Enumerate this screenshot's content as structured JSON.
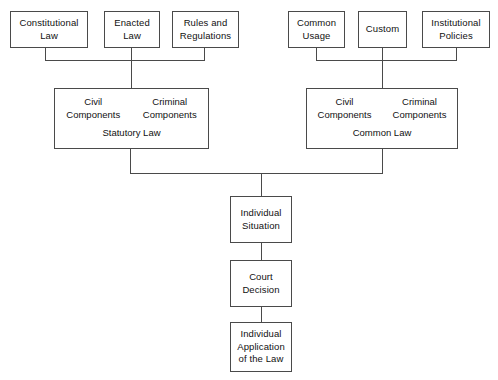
{
  "diagram": {
    "background_color": "#ffffff",
    "line_color": "#4a4a4a",
    "text_color": "#111111",
    "branches": {
      "left": {
        "name": "Statutory Law branch",
        "sources": [
          {
            "id": "constitutional-law",
            "line1": "Constitutional",
            "line2": "Law"
          },
          {
            "id": "enacted-law",
            "line1": "Enacted",
            "line2": "Law"
          },
          {
            "id": "rules-and-regulations",
            "line1": "Rules and",
            "line2": "Regulations"
          }
        ],
        "result": {
          "id": "statutory-law",
          "title": "Statutory Law",
          "columns": [
            {
              "id": "civil-components",
              "line1": "Civil",
              "line2": "Components"
            },
            {
              "id": "criminal-components",
              "line1": "Criminal",
              "line2": "Components"
            }
          ]
        }
      },
      "right": {
        "name": "Common Law branch",
        "sources": [
          {
            "id": "common-usage",
            "line1": "Common",
            "line2": "Usage"
          },
          {
            "id": "custom",
            "line1": "Custom",
            "line2": ""
          },
          {
            "id": "institutional-policies",
            "line1": "Institutional",
            "line2": "Policies"
          }
        ],
        "result": {
          "id": "common-law",
          "title": "Common Law",
          "columns": [
            {
              "id": "civil-components",
              "line1": "Civil",
              "line2": "Components"
            },
            {
              "id": "criminal-components",
              "line1": "Criminal",
              "line2": "Components"
            }
          ]
        }
      }
    },
    "chain": [
      {
        "id": "individual-situation",
        "line1": "Individual",
        "line2": "Situation",
        "line3": ""
      },
      {
        "id": "court-decision",
        "line1": "Court",
        "line2": "Decision",
        "line3": ""
      },
      {
        "id": "individual-application-of-the-law",
        "line1": "Individual",
        "line2": "Application",
        "line3": "of the Law"
      }
    ]
  }
}
